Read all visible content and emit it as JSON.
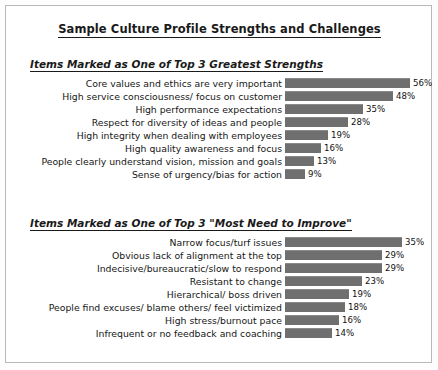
{
  "document": {
    "title": "Sample Culture Profile Strengths and Challenges"
  },
  "sections": [
    {
      "heading": "Items Marked as One of Top 3 Greatest Strengths",
      "items": [
        {
          "label": "Core values and ethics are very important",
          "value": "56%"
        },
        {
          "label": "High service consciousness/ focus on customer",
          "value": "48%"
        },
        {
          "label": "High performance expectations",
          "value": "35%"
        },
        {
          "label": "Respect for diversity of ideas and people",
          "value": "28%"
        },
        {
          "label": "High integrity when dealing with employees",
          "value": "19%"
        },
        {
          "label": "High quality awareness and focus",
          "value": "16%"
        },
        {
          "label": "People clearly understand vision, mission and goals",
          "value": "13%"
        },
        {
          "label": "Sense of urgency/bias for action",
          "value": "9%"
        }
      ]
    },
    {
      "heading": "Items Marked as One of Top 3 \"Most Need to Improve\"",
      "items": [
        {
          "label": "Narrow focus/turf issues",
          "value": "35%"
        },
        {
          "label": "Obvious lack of alignment at the top",
          "value": "29%"
        },
        {
          "label": "Indecisive/bureaucratic/slow to respond",
          "value": "29%"
        },
        {
          "label": "Resistant to change",
          "value": "23%"
        },
        {
          "label": "Hierarchical/ boss driven",
          "value": "19%"
        },
        {
          "label": "People find excuses/ blame others/ feel victimized",
          "value": "18%"
        },
        {
          "label": "High stress/burnout pace",
          "value": "16%"
        },
        {
          "label": "Infrequent or no feedback and coaching",
          "value": "14%"
        }
      ]
    }
  ],
  "chart_data": [
    {
      "type": "bar",
      "title": "Items Marked as One of Top 3 Greatest Strengths",
      "orientation": "horizontal",
      "xlabel": "",
      "ylabel": "",
      "xlim": [
        0,
        60
      ],
      "grid": false,
      "legend": "none",
      "data_labels": true,
      "px_per_unit": 2.24,
      "categories": [
        "Core values and ethics are very important",
        "High service consciousness/ focus on customer",
        "High performance expectations",
        "Respect for diversity of ideas and people",
        "High integrity when dealing with employees",
        "High quality awareness and focus",
        "People clearly understand vision, mission and goals",
        "Sense of urgency/bias for action"
      ],
      "values": [
        56,
        48,
        35,
        28,
        19,
        16,
        13,
        9
      ],
      "value_labels": [
        "56%",
        "48%",
        "35%",
        "28%",
        "19%",
        "16%",
        "13%",
        "9%"
      ]
    },
    {
      "type": "bar",
      "title": "Items Marked as One of Top 3 \"Most Need to Improve\"",
      "orientation": "horizontal",
      "xlabel": "",
      "ylabel": "",
      "xlim": [
        0,
        38
      ],
      "grid": false,
      "legend": "none",
      "data_labels": true,
      "px_per_unit": 3.35,
      "categories": [
        "Narrow focus/turf issues",
        "Obvious lack of alignment at the top",
        "Indecisive/bureaucratic/slow to respond",
        "Resistant to change",
        "Hierarchical/ boss driven",
        "People find excuses/ blame others/ feel victimized",
        "High stress/burnout pace",
        "Infrequent or no feedback and coaching"
      ],
      "values": [
        35,
        29,
        29,
        23,
        19,
        18,
        16,
        14
      ],
      "value_labels": [
        "35%",
        "29%",
        "29%",
        "23%",
        "19%",
        "18%",
        "16%",
        "14%"
      ]
    }
  ],
  "style": {
    "bar_color": "#6f6f6f",
    "text_color": "#161616",
    "border_color": "#b9b9b9",
    "background": "#ffffff"
  }
}
